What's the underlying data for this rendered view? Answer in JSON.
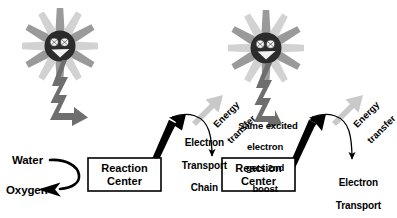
{
  "diagram": {
    "colors": {
      "ink": "#000000",
      "background": "#ffffff",
      "ray_dark": "#9a9a9a",
      "ray_light": "#d0d0d0",
      "face": "#2b2b2b",
      "bolt": "#6e6e6e",
      "energy_arrow": "#c9c9c9",
      "box_border": "#000000",
      "box_fill": "#ffffff"
    },
    "suns": [
      {
        "name": "sun-left",
        "eyes": 2,
        "mouth": "smile"
      },
      {
        "name": "sun-right",
        "eyes": 2,
        "mouth": "smile"
      }
    ],
    "boxes": [
      {
        "label_line1": "Reaction",
        "label_line2": "Center"
      },
      {
        "label_line1": "Reaction",
        "label_line2": "Center"
      }
    ],
    "labels": {
      "water": "Water",
      "oxygen": "Oxygen",
      "etc_middle_line1": "Electron",
      "etc_middle_line2": "Transport",
      "etc_middle_line3": "Chain",
      "etc_right_line1": "Electron",
      "etc_right_line2": "Transport",
      "etc_right_line3": "Chain",
      "note_line1": "Same excited",
      "note_line2": "electron",
      "note_line3": "gets 2nd",
      "note_line4": "boost",
      "energy_transfer_middle_line1": "Energy",
      "energy_transfer_middle_line2": "transfer",
      "energy_transfer_right_line1": "Energy",
      "energy_transfer_right_line2": "transfer"
    },
    "arrows": {
      "light_bolt_left": "zigzag light arrow from left sun to first reaction center",
      "light_bolt_right": "zigzag light arrow from right sun to second reaction center",
      "water_to_oxygen": "curved arrow from Water through reaction center to Oxygen",
      "electron_out_left": "thick black arrow up-right out of first reaction center",
      "electron_down_middle": "thin curved arrow down into second reaction center",
      "electron_out_right": "thick black arrow up-right out of second reaction center",
      "electron_down_right": "thin curved arrow down to right electron transport chain",
      "energy_transfer_middle": "gray block arrow pointing up-right",
      "energy_transfer_right": "gray block arrow pointing up-right"
    }
  }
}
